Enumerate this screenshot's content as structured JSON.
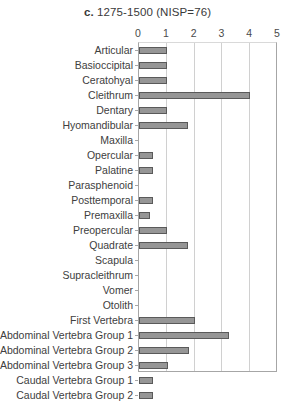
{
  "chart_data": {
    "type": "bar",
    "orientation": "horizontal",
    "title": "c. 1275-1500 (NISP=76)",
    "title_lead": "c.",
    "title_rest": " 1275-1500 (NISP=76)",
    "xlabel": "",
    "ylabel": "",
    "xlim": [
      0,
      5
    ],
    "xticks": [
      0,
      1,
      2,
      3,
      4,
      5
    ],
    "xtick_labels": [
      "0",
      "1",
      "2",
      "3",
      "4",
      "5"
    ],
    "grid": true,
    "legend": false,
    "bar_color": "#969696",
    "bar_edge_color": "#5a5a5a",
    "categories": [
      "Articular",
      "Basioccipital",
      "Ceratohyal",
      "Cleithrum",
      "Dentary",
      "Hyomandibular",
      "Maxilla",
      "Opercular",
      "Palatine",
      "Parasphenoid",
      "Posttemporal",
      "Premaxilla",
      "Preopercular",
      "Quadrate",
      "Scapula",
      "Supracleithrum",
      "Vomer",
      "Otolith",
      "First Vertebra",
      "Abdominal Vertebra Group 1",
      "Abdominal Vertebra Group 2",
      "Abdominal Vertebra Group 3",
      "Caudal Vertebra Group 1",
      "Caudal Vertebra Group 2"
    ],
    "values": [
      1.0,
      1.0,
      1.0,
      4.0,
      1.0,
      1.75,
      0,
      0.5,
      0.5,
      0,
      0.5,
      0.4,
      1.0,
      1.75,
      0,
      0,
      0,
      0,
      2.0,
      3.25,
      1.8,
      1.05,
      0.5,
      0.5
    ]
  }
}
